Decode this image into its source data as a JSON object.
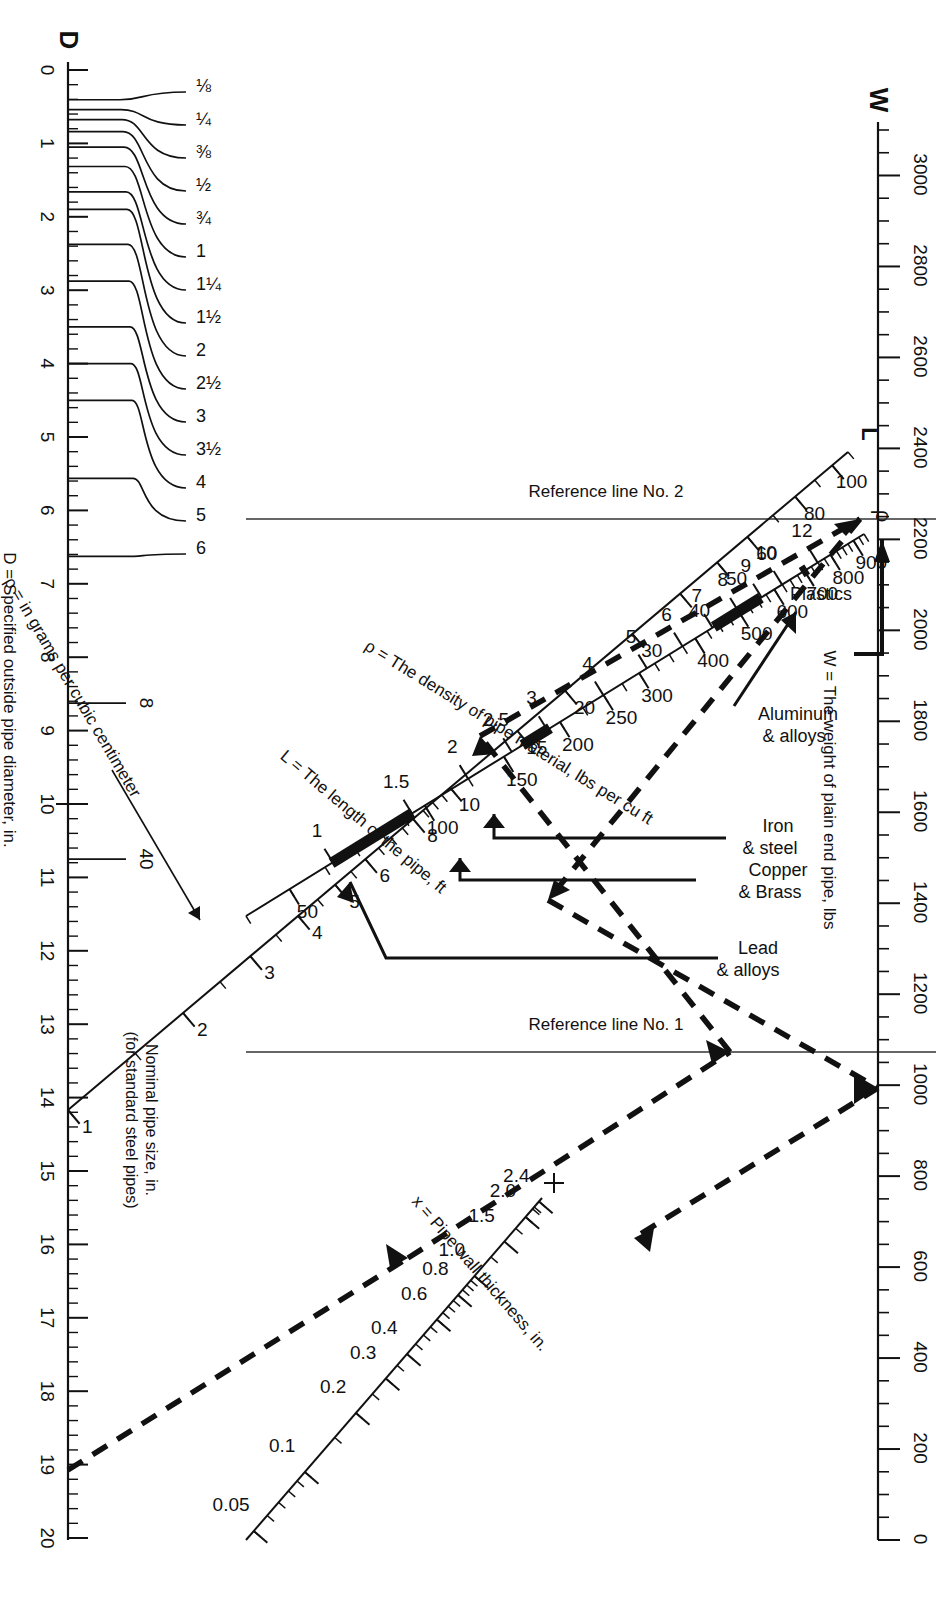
{
  "scales": {
    "W": {
      "symbol": "W",
      "caption": "W = The weight of plain end pipe, lbs",
      "major_labels": [
        "0",
        "200",
        "400",
        "600",
        "800",
        "1000",
        "1200",
        "1400",
        "1600",
        "1800",
        "2000",
        "2200",
        "2400",
        "2600",
        "2800",
        "3000"
      ],
      "min": 0,
      "max": 3100,
      "major_step": 200,
      "minor_step": 50
    },
    "L": {
      "symbol": "L",
      "caption": "L = The length of the pipe, ft",
      "labels": [
        "1",
        "2",
        "3",
        "4",
        "5",
        "6",
        "8",
        "10",
        "15",
        "20",
        "30",
        "40",
        "50",
        "60",
        "80",
        "100"
      ],
      "min": 1,
      "max": 110,
      "type": "log"
    },
    "rho": {
      "symbol": "ρ",
      "caption": "ρ = The density of pipe material, lbs per cu ft",
      "caption2": "ρ = in grams per cubic centimeter",
      "labels_lbs": [
        "50",
        "100",
        "150",
        "200",
        "250",
        "300",
        "400",
        "500",
        "600",
        "700",
        "800",
        "900"
      ],
      "labels_gcc": [
        "1",
        "1.5",
        "2",
        "2.5",
        "3",
        "4",
        "5",
        "6",
        "7",
        "8",
        "9",
        "10",
        "12"
      ],
      "min": 40,
      "max": 950,
      "type": "log"
    },
    "x": {
      "symbol": "x",
      "caption": "x = Pipe wall thickness, in.",
      "labels": [
        "0.05",
        "0.1",
        "0.2",
        "0.3",
        "0.4",
        "0.6",
        "0.8",
        "1.0",
        "1.5",
        "2.0",
        "2.4"
      ],
      "min": 0.045,
      "max": 2.5,
      "type": "log"
    },
    "D": {
      "symbol": "D",
      "caption": "D = Specified outside pipe diameter, in.",
      "caption2_line1": "Nominal pipe size, in.",
      "caption2_line2": "(for standard steel pipes)",
      "major_labels": [
        "0",
        "1",
        "2",
        "3",
        "4",
        "5",
        "6",
        "7",
        "8",
        "9",
        "10",
        "11",
        "12",
        "13",
        "14",
        "15",
        "16",
        "17",
        "18",
        "19",
        "20"
      ],
      "min": 0,
      "max": 20,
      "major_step": 1,
      "minor_step": 0.2
    }
  },
  "reference_lines": [
    {
      "id": "ref1",
      "label": "Reference line No. 1"
    },
    {
      "id": "ref2",
      "label": "Reference line No. 2"
    }
  ],
  "nominal_pipe_sizes": [
    {
      "label": "⅛",
      "od": 0.405
    },
    {
      "label": "¼",
      "od": 0.54
    },
    {
      "label": "⅜",
      "od": 0.675
    },
    {
      "label": "½",
      "od": 0.84
    },
    {
      "label": "¾",
      "od": 1.05
    },
    {
      "label": "1",
      "od": 1.315
    },
    {
      "label": "1¼",
      "od": 1.66
    },
    {
      "label": "1½",
      "od": 1.9
    },
    {
      "label": "2",
      "od": 2.375
    },
    {
      "label": "2½",
      "od": 2.875
    },
    {
      "label": "3",
      "od": 3.5
    },
    {
      "label": "3½",
      "od": 4.0
    },
    {
      "label": "4",
      "od": 4.5
    },
    {
      "label": "5",
      "od": 5.563
    },
    {
      "label": "6",
      "od": 6.625
    },
    {
      "label": "8",
      "od": 8.625
    },
    {
      "label": "40",
      "od": 10.75
    }
  ],
  "material_callouts": [
    {
      "name": "Plastics",
      "label_line1": "Plastics",
      "label_line2": ""
    },
    {
      "name": "Aluminum & alloys",
      "label_line1": "Aluminum",
      "label_line2": "& alloys"
    },
    {
      "name": "Iron & steel",
      "label_line1": "Iron",
      "label_line2": "& steel"
    },
    {
      "name": "Copper & Brass",
      "label_line1": "Copper",
      "label_line2": "& Brass"
    },
    {
      "name": "Lead & alloys",
      "label_line1": "Lead",
      "label_line2": "& alloys"
    }
  ],
  "chart_data": {
    "type": "nomogram",
    "axes": [
      {
        "name": "W",
        "label": "W = The weight of plain end pipe, lbs",
        "ticks": [
          0,
          200,
          400,
          600,
          800,
          1000,
          1200,
          1400,
          1600,
          1800,
          2000,
          2200,
          2400,
          2600,
          2800,
          3000
        ],
        "range": [
          0,
          3100
        ],
        "scale": "linear"
      },
      {
        "name": "L",
        "label": "L = The length of the pipe, ft",
        "ticks": [
          1,
          2,
          3,
          4,
          5,
          6,
          8,
          10,
          15,
          20,
          30,
          40,
          50,
          60,
          80,
          100
        ],
        "range": [
          1,
          110
        ],
        "scale": "log"
      },
      {
        "name": "rho",
        "label": "ρ = The density of pipe material, lbs per cu ft",
        "ticks": [
          50,
          100,
          150,
          200,
          250,
          300,
          400,
          500,
          600,
          700,
          800,
          900
        ],
        "range": [
          40,
          950
        ],
        "scale": "log"
      },
      {
        "name": "rho_gcc",
        "label": "ρ = in grams per cubic centimeter",
        "ticks": [
          1,
          1.5,
          2,
          2.5,
          3,
          4,
          5,
          6,
          7,
          8,
          9,
          10,
          12
        ],
        "range": [
          0.64,
          15.2
        ],
        "scale": "log"
      },
      {
        "name": "x",
        "label": "x = Pipe wall thickness, in.",
        "ticks": [
          0.05,
          0.1,
          0.2,
          0.3,
          0.4,
          0.6,
          0.8,
          1.0,
          1.5,
          2.0,
          2.4
        ],
        "range": [
          0.045,
          2.5
        ],
        "scale": "log"
      },
      {
        "name": "D",
        "label": "D = Specified outside pipe diameter, in.",
        "ticks": [
          0,
          1,
          2,
          3,
          4,
          5,
          6,
          7,
          8,
          9,
          10,
          11,
          12,
          13,
          14,
          15,
          16,
          17,
          18,
          19,
          20
        ],
        "range": [
          0,
          20
        ],
        "scale": "linear"
      }
    ],
    "material_bands_lbs_per_cu_ft": [
      {
        "material": "Plastics",
        "from": 62,
        "to": 94
      },
      {
        "material": "Aluminum & alloys",
        "from": 165,
        "to": 190
      },
      {
        "material": "Iron & steel",
        "from": 440,
        "to": 500
      },
      {
        "material": "Copper & Brass",
        "from": 500,
        "to": 560
      },
      {
        "material": "Lead & alloys",
        "from": 690,
        "to": 710
      }
    ],
    "worked_example_path": [
      {
        "axis": "D",
        "value": 10.0
      },
      {
        "axis": "x",
        "value": 0.12
      },
      {
        "axis": "ref1",
        "value": null
      },
      {
        "axis": "rho",
        "value": 490
      },
      {
        "axis": "ref2",
        "value": null
      },
      {
        "axis": "L",
        "value": 10
      },
      {
        "axis": "W",
        "value": 1000
      }
    ],
    "grid": false,
    "legend": "none"
  }
}
